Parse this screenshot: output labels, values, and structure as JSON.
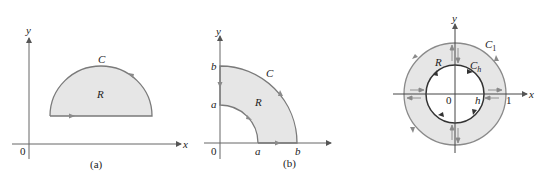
{
  "colors": {
    "axis": "#666666",
    "curve": "#7a7a7a",
    "fill": "#e6e6e6",
    "inner_curve": "#333333",
    "arrow": "#8a8a8a",
    "text": "#222222"
  },
  "figures": [
    {
      "id": "a",
      "caption": "(a)",
      "axes": {
        "x_label": "x",
        "y_label": "y",
        "origin_label": "0"
      },
      "curve_label": "C",
      "region_label": "R",
      "shape": "semicircular region above horizontal segment, counterclockwise orientation"
    },
    {
      "id": "b",
      "caption": "(b)",
      "axes": {
        "x_label": "x",
        "y_label": "y",
        "origin_label": "0"
      },
      "curve_label": "C",
      "region_label": "R",
      "tick_labels": {
        "x_inner": "a",
        "x_outer": "b",
        "y_inner": "a",
        "y_outer": "b"
      },
      "shape": "quarter annulus between radii a and b in first quadrant"
    },
    {
      "id": "c",
      "caption": "",
      "axes": {
        "x_label": "x",
        "y_label": "y",
        "origin_label": "0"
      },
      "outer_curve_label": "C",
      "outer_curve_subscript": "1",
      "inner_curve_label": "C",
      "inner_curve_subscript": "h",
      "region_label": "R",
      "tick_labels": {
        "inner_radius": "h",
        "outer_radius": "1"
      },
      "shape": "annulus between circles of radius h and 1 with cuts along axes"
    }
  ]
}
